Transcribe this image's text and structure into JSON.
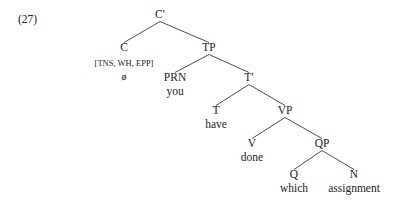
{
  "figure": {
    "example_number": "(27)",
    "width": 398,
    "height": 212,
    "background_color": "#ffffff",
    "line_color": "#3a3a3a",
    "text_color": "#232323"
  },
  "tree": {
    "nodes": [
      {
        "id": "Cbar",
        "label": "C′",
        "x": 160,
        "y": 18,
        "word": null,
        "features": null
      },
      {
        "id": "C",
        "label": "C",
        "x": 124,
        "y": 51,
        "word": "ø",
        "features": "[TNS, WH, EPP]"
      },
      {
        "id": "TP",
        "label": "TP",
        "x": 209,
        "y": 51,
        "word": null,
        "features": null
      },
      {
        "id": "PRN",
        "label": "PRN",
        "x": 175,
        "y": 81,
        "word": "you",
        "features": null
      },
      {
        "id": "Tbar",
        "label": "T′",
        "x": 249,
        "y": 81,
        "word": null,
        "features": null
      },
      {
        "id": "T",
        "label": "T",
        "x": 216,
        "y": 114,
        "word": "have",
        "features": null
      },
      {
        "id": "VP",
        "label": "VP",
        "x": 285,
        "y": 114,
        "word": null,
        "features": null
      },
      {
        "id": "V",
        "label": "V",
        "x": 252,
        "y": 147,
        "word": "done",
        "features": null
      },
      {
        "id": "QP",
        "label": "QP",
        "x": 322,
        "y": 147,
        "word": null,
        "features": null
      },
      {
        "id": "Q",
        "label": "Q",
        "x": 294,
        "y": 178,
        "word": "which",
        "features": null
      },
      {
        "id": "N",
        "label": "N",
        "x": 354,
        "y": 178,
        "word": "assignment",
        "features": null
      }
    ],
    "edges": [
      {
        "from": "Cbar",
        "to": "C"
      },
      {
        "from": "Cbar",
        "to": "TP"
      },
      {
        "from": "TP",
        "to": "PRN"
      },
      {
        "from": "TP",
        "to": "Tbar"
      },
      {
        "from": "Tbar",
        "to": "T"
      },
      {
        "from": "Tbar",
        "to": "VP"
      },
      {
        "from": "VP",
        "to": "V"
      },
      {
        "from": "VP",
        "to": "QP"
      },
      {
        "from": "QP",
        "to": "Q"
      },
      {
        "from": "QP",
        "to": "N"
      }
    ]
  }
}
